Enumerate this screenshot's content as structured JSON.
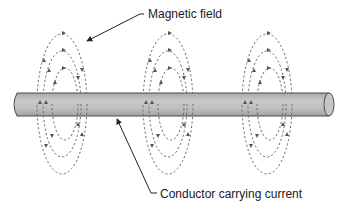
{
  "diagram": {
    "type": "physics-illustration",
    "labels": {
      "magnetic_field": "Magnetic field",
      "conductor": "Conductor carrying current"
    },
    "colors": {
      "background": "#ffffff",
      "rod_fill": "#b9b9b9",
      "rod_highlight": "#cfcfcf",
      "rod_outline": "#4a4a4a",
      "field_lines": "#666666",
      "text": "#1a1a1a",
      "leader_lines": "#222222"
    },
    "field_groups": [
      {
        "name": "left",
        "cx": 62
      },
      {
        "name": "middle",
        "cx": 168
      },
      {
        "name": "right",
        "cx": 268
      }
    ],
    "loops_per_group": 3
  }
}
